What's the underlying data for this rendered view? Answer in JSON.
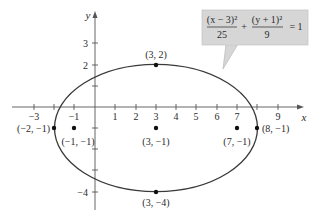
{
  "figure": {
    "equation": {
      "term1_numerator": "(x − 3)²",
      "term1_denominator": "25",
      "plus": "+",
      "term2_numerator": "(y + 1)²",
      "term2_denominator": "9",
      "rhs": "= 1"
    },
    "axes": {
      "x_label": "x",
      "y_label": "y",
      "x_ticks": [
        "−3",
        "−1",
        "1",
        "2",
        "3",
        "4",
        "5",
        "6",
        "7",
        "9"
      ],
      "y_ticks": [
        "3",
        "2",
        "−4"
      ]
    },
    "points": [
      {
        "label": "(3, 2)",
        "x": 3,
        "y": 2,
        "role": "vertex (top)"
      },
      {
        "label": "(−2, −1)",
        "x": -2,
        "y": -1,
        "role": "vertex (left)"
      },
      {
        "label": "(−1, −1)",
        "x": -1,
        "y": -1,
        "role": "focus"
      },
      {
        "label": "(3, −1)",
        "x": 3,
        "y": -1,
        "role": "center"
      },
      {
        "label": "(7, −1)",
        "x": 7,
        "y": -1,
        "role": "focus"
      },
      {
        "label": "(8, −1)",
        "x": 8,
        "y": -1,
        "role": "vertex (right)"
      },
      {
        "label": "(3, −4)",
        "x": 3,
        "y": -4,
        "role": "vertex (bottom)"
      }
    ],
    "ellipse": {
      "center": [
        3,
        -1
      ],
      "a": 5,
      "b": 3
    },
    "colors": {
      "curve": "#3a3a3a",
      "axis": "#555555",
      "callout_fill": "#d6d6d6",
      "callout_border": "#b8b8b8",
      "point": "#111111"
    }
  }
}
